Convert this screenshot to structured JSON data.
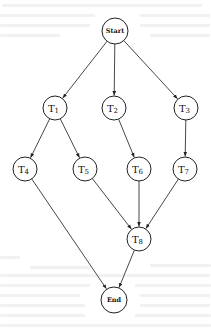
{
  "diagram": {
    "type": "directed-acyclic-graph",
    "nodes": [
      {
        "id": "start",
        "label": "Start",
        "sub": "",
        "x": 115,
        "y": 31,
        "r": 13
      },
      {
        "id": "t1",
        "label": "T",
        "sub": "1",
        "x": 55,
        "y": 108,
        "r": 12
      },
      {
        "id": "t2",
        "label": "T",
        "sub": "2",
        "x": 114,
        "y": 108,
        "r": 12
      },
      {
        "id": "t3",
        "label": "T",
        "sub": "3",
        "x": 186,
        "y": 108,
        "r": 12
      },
      {
        "id": "t4",
        "label": "T",
        "sub": "4",
        "x": 25,
        "y": 169,
        "r": 12
      },
      {
        "id": "t5",
        "label": "T",
        "sub": "5",
        "x": 85,
        "y": 169,
        "r": 12
      },
      {
        "id": "t6",
        "label": "T",
        "sub": "6",
        "x": 139,
        "y": 169,
        "r": 12
      },
      {
        "id": "t7",
        "label": "T",
        "sub": "7",
        "x": 185,
        "y": 169,
        "r": 12
      },
      {
        "id": "t8",
        "label": "T",
        "sub": "8",
        "x": 139,
        "y": 239,
        "r": 12
      },
      {
        "id": "end",
        "label": "End",
        "sub": "",
        "x": 114,
        "y": 300,
        "r": 13
      }
    ],
    "edges": [
      {
        "from": "start",
        "to": "t1"
      },
      {
        "from": "start",
        "to": "t2"
      },
      {
        "from": "start",
        "to": "t3"
      },
      {
        "from": "t1",
        "to": "t4"
      },
      {
        "from": "t1",
        "to": "t5"
      },
      {
        "from": "t2",
        "to": "t6"
      },
      {
        "from": "t3",
        "to": "t7"
      },
      {
        "from": "t4",
        "to": "end"
      },
      {
        "from": "t5",
        "to": "t8"
      },
      {
        "from": "t6",
        "to": "t8"
      },
      {
        "from": "t7",
        "to": "t8"
      },
      {
        "from": "t8",
        "to": "end"
      }
    ],
    "colors": {
      "stroke": "#222222",
      "fill": "#ffffff",
      "background": "#ffffff"
    }
  }
}
